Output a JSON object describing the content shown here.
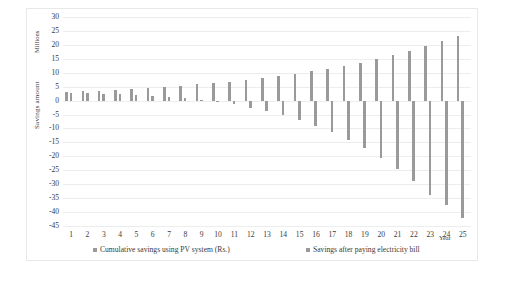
{
  "chart_data": {
    "type": "bar",
    "title": "",
    "xlabel": "Year",
    "ylabel": "Savings amount",
    "yunit": "Millions",
    "ylim": [
      -45,
      30
    ],
    "ytick_step": 5,
    "grid": true,
    "legend_position": "bottom",
    "categories": [
      "1",
      "2",
      "3",
      "4",
      "5",
      "6",
      "7",
      "8",
      "9",
      "10",
      "11",
      "12",
      "13",
      "14",
      "15",
      "16",
      "17",
      "18",
      "19",
      "20",
      "21",
      "22",
      "23",
      "24",
      "25"
    ],
    "yticks": [
      "30",
      "25",
      "20",
      "15",
      "10",
      "5",
      "0",
      "-5",
      "-10",
      "-15",
      "-20",
      "-25",
      "-30",
      "-35",
      "-40",
      "-45"
    ],
    "series": [
      {
        "name": "Cumulative savings using PV system (Rs.)",
        "color": "#9a9a9a",
        "values": [
          3.0,
          3.3,
          3.6,
          3.9,
          4.2,
          4.5,
          4.9,
          5.3,
          5.8,
          6.3,
          6.8,
          7.4,
          8.1,
          8.8,
          9.6,
          10.5,
          11.4,
          12.5,
          13.6,
          14.9,
          16.3,
          17.8,
          19.5,
          21.3,
          23.3
        ]
      },
      {
        "name": "Savings after paying electricity bill",
        "color": "#9a9a9a",
        "values": [
          2.6,
          2.6,
          2.5,
          2.3,
          2.1,
          1.8,
          1.4,
          0.9,
          0.3,
          -0.5,
          -1.4,
          -2.5,
          -3.8,
          -5.3,
          -7.0,
          -9.0,
          -11.3,
          -14.0,
          -17.0,
          -20.5,
          -24.5,
          -29.0,
          -34.0,
          -37.5,
          -42.0
        ]
      }
    ],
    "legend": [
      {
        "label": "Cumulative savings using PV system (Rs.)",
        "color": "#9a9a9a"
      },
      {
        "label": "Savings after paying electricity bill",
        "color": "#9a9a9a"
      }
    ]
  }
}
